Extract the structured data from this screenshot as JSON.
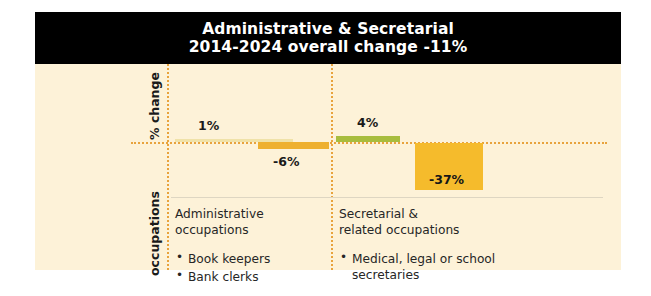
{
  "header": {
    "title_line_1": "Administrative & Secretarial",
    "title_line_2": "2014-2024 overall change -11%"
  },
  "axes": {
    "y_caption": "% change",
    "x_caption": "occupations"
  },
  "colors": {
    "card_background": "#fdf2d8",
    "banner_background": "#000000",
    "banner_text": "#ffffff",
    "rail_dotted": "#e8a33d",
    "bar_positive_pale": "#f0e2a8",
    "bar_positive_green": "#a8bd3e",
    "bar_negative_orange": "#eeb02f",
    "bar_negative_orange_large": "#f5bb2c",
    "divider": "#ded6c2"
  },
  "bars": {
    "admin_positive_label": "1%",
    "admin_negative_label": "-6%",
    "secretarial_positive_label": "4%",
    "secretarial_negative_label": "-37%"
  },
  "groups": [
    {
      "heading": "Administrative\noccupations",
      "items": [
        "Book keepers",
        "Bank clerks"
      ]
    },
    {
      "heading": "Secretarial &\nrelated occupations",
      "items": [
        "Medical, legal or school secretaries"
      ]
    }
  ],
  "chart_data": {
    "type": "bar",
    "title": "Administrative & Secretarial",
    "subtitle": "2014-2024 overall change -11%",
    "xlabel": "occupations",
    "ylabel": "% change",
    "grid": false,
    "legend": "none",
    "overall_change": -11,
    "zero_baseline": 0,
    "categories": [
      "Administrative occupations",
      "Secretarial & related occupations"
    ],
    "series": [
      {
        "name": "increase",
        "values": [
          1,
          4
        ],
        "labels": [
          "1%",
          "4%"
        ]
      },
      {
        "name": "decrease",
        "values": [
          -6,
          -37
        ],
        "labels": [
          "-6%",
          "-37%"
        ]
      }
    ],
    "ylim": [
      -40,
      8
    ]
  }
}
